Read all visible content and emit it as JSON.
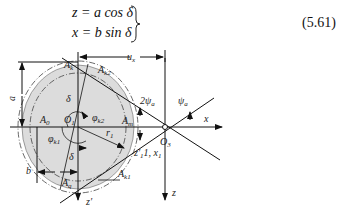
{
  "equations": {
    "line1": "z = a cos δ",
    "line2": "x = b sin δ",
    "number": "(5.61)"
  },
  "diagram": {
    "labels": {
      "ux": "u",
      "ux_sub": "x",
      "Ak": "A",
      "Ak_sub": "k",
      "Ak2": "A",
      "Ak2_sub": "k2",
      "a": "a",
      "delta_top": "δ",
      "O1": "O",
      "O1_sub": "1",
      "phi_k2": "φ",
      "phi_k2_sub": "k2",
      "Ao": "A",
      "Ao_sub": "0",
      "Am": "A",
      "Am_sub": "m",
      "two_psi": "2ψ",
      "two_psi_sub": "a",
      "psi": "ψ",
      "psi_sub": "a",
      "x": "x",
      "O3": "O",
      "O3_sub": "3",
      "r1": "r",
      "r1_sub": "1",
      "phi_k1": "φ",
      "phi_k1_sub": "k1",
      "delta_bottom": "δ",
      "z1x1": "z′",
      "z1x1_rest": "1, x",
      "z1x1_sub": "1",
      "b": "b",
      "Ak1": "A",
      "Ak1_sub": "k1",
      "Aq": "A",
      "Aq_sub": "q",
      "z_prime": "z′",
      "z": "z"
    }
  }
}
